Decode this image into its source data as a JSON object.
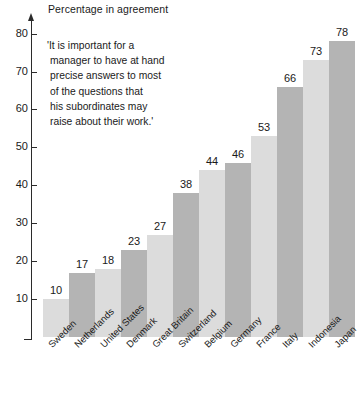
{
  "chart_data": {
    "type": "bar",
    "title": "Percentage in agreement",
    "xlabel": "",
    "ylabel": "",
    "ylim": [
      0,
      80
    ],
    "ytick_values": [
      10,
      20,
      30,
      40,
      50,
      60,
      70,
      80
    ],
    "ytick_labels": [
      "10",
      "20",
      "30",
      "40",
      "50",
      "60",
      "70",
      "80"
    ],
    "grid": false,
    "legend": null,
    "categories": [
      "Sweden",
      "Netherlands",
      "United States",
      "Denmark",
      "Great Britain",
      "Switzerland",
      "Belgium",
      "Germany",
      "France",
      "Italy",
      "Indonesia",
      "Japan"
    ],
    "values": [
      10,
      17,
      18,
      23,
      27,
      38,
      44,
      46,
      53,
      66,
      73,
      78
    ],
    "value_labels": [
      "10",
      "17",
      "18",
      "23",
      "27",
      "38",
      "44",
      "46",
      "53",
      "66",
      "73",
      "78"
    ],
    "bar_colors": [
      "#dcdcdc",
      "#b4b4b4",
      "#dcdcdc",
      "#b4b4b4",
      "#dcdcdc",
      "#b4b4b4",
      "#dcdcdc",
      "#b4b4b4",
      "#dcdcdc",
      "#b4b4b4",
      "#dcdcdc",
      "#b4b4b4"
    ],
    "annotation": {
      "lines": [
        "'It is important for a",
        "manager to have at hand",
        "precise answers to most",
        "of the questions that",
        "his subordinates may",
        "raise about their work.'"
      ]
    }
  },
  "colors": {
    "axis": "#2b2b2b",
    "text": "#1a1a1a",
    "background": "#ffffff",
    "bar_light": "#dcdcdc",
    "bar_dark": "#b4b4b4"
  }
}
